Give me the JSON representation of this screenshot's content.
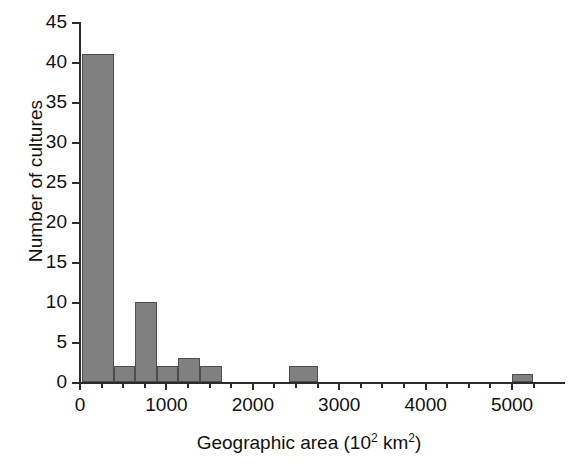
{
  "chart_data": {
    "type": "bar",
    "title": "",
    "xlabel": "Geographic area (10² km²)",
    "xlabel_parts": {
      "text_before": "Geographic area (10",
      "sup1": "2",
      "text_mid": " km",
      "sup2": "2",
      "text_after": ")"
    },
    "ylabel": "Number of cultures",
    "xlim": [
      0,
      5300
    ],
    "ylim": [
      0,
      45
    ],
    "grid": false,
    "legend": null,
    "bar_color": "#808080",
    "bar_edge_color": "#4d4d4d",
    "axis_color": "#2b2b2b",
    "xticks_major": [
      0,
      1000,
      2000,
      3000,
      4000,
      5000
    ],
    "xtick_labels": [
      "0",
      "1000",
      "2000",
      "3000",
      "4000",
      "5000"
    ],
    "xticks_minor": [
      250,
      500,
      750,
      1250,
      1500,
      1750,
      2250,
      2500,
      2750,
      3250,
      3500,
      3750,
      4250,
      4500,
      4750,
      5250
    ],
    "yticks": [
      0,
      5,
      10,
      15,
      20,
      25,
      30,
      35,
      40,
      45
    ],
    "ytick_labels": [
      "0",
      "5",
      "10",
      "15",
      "20",
      "25",
      "30",
      "35",
      "40",
      "45"
    ],
    "bin_width": 250,
    "bins": [
      {
        "x0": 30,
        "x1": 400,
        "value": 41
      },
      {
        "x0": 400,
        "x1": 650,
        "value": 2
      },
      {
        "x0": 650,
        "x1": 900,
        "value": 10
      },
      {
        "x0": 900,
        "x1": 1150,
        "value": 2
      },
      {
        "x0": 1150,
        "x1": 1400,
        "value": 3
      },
      {
        "x0": 1400,
        "x1": 1650,
        "value": 2
      },
      {
        "x0": 2430,
        "x1": 2770,
        "value": 2
      },
      {
        "x0": 5010,
        "x1": 5250,
        "value": 1
      }
    ],
    "categories": [
      "30-400",
      "400-650",
      "650-900",
      "900-1150",
      "1150-1400",
      "1400-1650",
      "2430-2770",
      "5010-5250"
    ],
    "values": [
      41,
      2,
      10,
      2,
      3,
      2,
      2,
      1
    ]
  }
}
